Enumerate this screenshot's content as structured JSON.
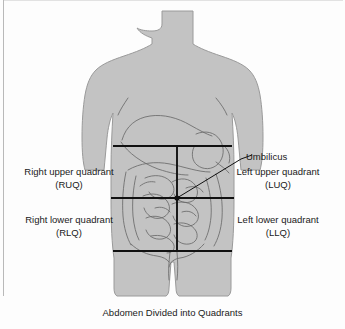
{
  "figure": {
    "caption": "Abdomen Divided into Quadrants",
    "colors": {
      "body_fill": "#c3c3c3",
      "body_stroke": "#8e8e8e",
      "organ_stroke": "#5d5d5d",
      "quadrant_line": "#111111",
      "text": "#1a1a1a",
      "background": "#fdfdfd"
    }
  },
  "labels": {
    "ruq": {
      "name": "Right upper quadrant",
      "abbr": "(RUQ)"
    },
    "rlq": {
      "name": "Right lower quadrant",
      "abbr": "(RLQ)"
    },
    "luq": {
      "name": "Left upper quadrant",
      "abbr": "(LUQ)"
    },
    "llq": {
      "name": "Left lower quadrant",
      "abbr": "(LLQ)"
    },
    "umbilicus": "Umbilicus"
  },
  "diagram": {
    "umbilicus_point": {
      "x": 177,
      "y": 198
    },
    "lines": {
      "upper_horizontal_y": 146,
      "umbilicus_horizontal_y": 198,
      "lower_horizontal_y": 251,
      "vertical_x": 177
    }
  }
}
